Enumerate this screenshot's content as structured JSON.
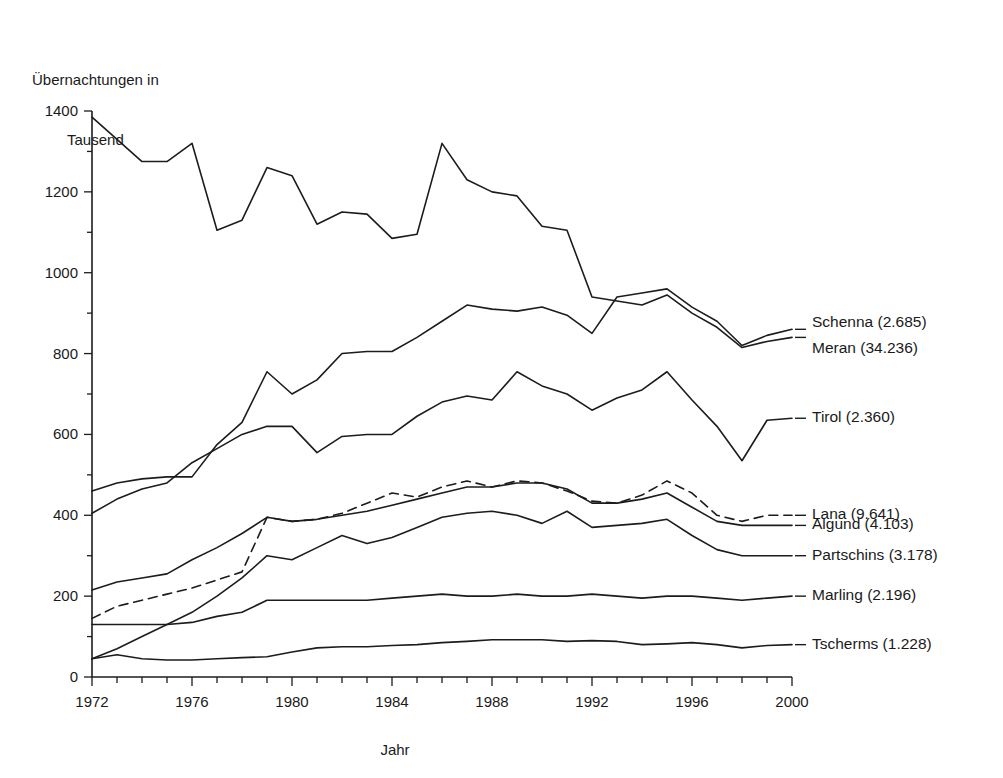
{
  "chart_data": {
    "type": "line",
    "title": "",
    "ylabel": "Übernachtungen in\nTausend",
    "ylabel_line1": "Übernachtungen in",
    "ylabel_line2": "Tausend",
    "xlabel": "Jahr",
    "xlim": [
      1972,
      2000
    ],
    "ylim": [
      0,
      1400
    ],
    "y_ticks": [
      0,
      200,
      400,
      600,
      800,
      1000,
      1200,
      1400
    ],
    "y_tick_labels": [
      "0",
      "200",
      "400",
      "600",
      "800",
      "1000",
      "1200",
      "1400"
    ],
    "y_minor_tick_step": 100,
    "x_ticks": [
      1972,
      1976,
      1980,
      1984,
      1988,
      1992,
      1996,
      2000
    ],
    "x_tick_labels": [
      "1972",
      "1976",
      "1980",
      "1984",
      "1988",
      "1992",
      "1996",
      "2000"
    ],
    "x_minor_tick_step": 1,
    "grid": false,
    "legend_position": "right-inline",
    "line_color": "#1c1c1c",
    "x": [
      1972,
      1973,
      1974,
      1975,
      1976,
      1977,
      1978,
      1979,
      1980,
      1981,
      1982,
      1983,
      1984,
      1985,
      1986,
      1987,
      1988,
      1989,
      1990,
      1991,
      1992,
      1993,
      1994,
      1995,
      1996,
      1997,
      1998,
      1999,
      2000
    ],
    "series": [
      {
        "name": "Meran",
        "label": "Meran (34.236)",
        "count": "34.236",
        "style": "solid",
        "values": [
          1385,
          1330,
          1275,
          1275,
          1320,
          1105,
          1130,
          1260,
          1240,
          1120,
          1150,
          1145,
          1085,
          1095,
          1320,
          1230,
          1200,
          1190,
          1115,
          1105,
          940,
          930,
          920,
          945,
          900,
          865,
          815,
          830,
          840
        ]
      },
      {
        "name": "Schenna",
        "label": "Schenna (2.685)",
        "count": "2.685",
        "style": "solid",
        "values": [
          460,
          480,
          490,
          495,
          495,
          575,
          630,
          755,
          700,
          735,
          800,
          805,
          805,
          840,
          880,
          920,
          910,
          905,
          915,
          895,
          850,
          940,
          950,
          960,
          915,
          880,
          820,
          845,
          860
        ]
      },
      {
        "name": "Tirol",
        "label": "Tirol (2.360)",
        "count": "2.360",
        "style": "solid",
        "values": [
          405,
          440,
          465,
          480,
          530,
          565,
          600,
          620,
          620,
          555,
          595,
          600,
          600,
          645,
          680,
          695,
          685,
          755,
          720,
          700,
          660,
          690,
          710,
          755,
          685,
          620,
          535,
          635,
          640
        ]
      },
      {
        "name": "Lana",
        "label": "Lana (9.641)",
        "count": "9.641",
        "style": "dashed",
        "values": [
          145,
          175,
          190,
          205,
          220,
          240,
          260,
          395,
          385,
          390,
          405,
          430,
          455,
          445,
          470,
          485,
          470,
          485,
          480,
          460,
          435,
          430,
          450,
          485,
          455,
          400,
          385,
          400,
          400
        ]
      },
      {
        "name": "Algund",
        "label": "Algund (4.103)",
        "count": "4.103",
        "style": "solid",
        "values": [
          215,
          235,
          245,
          255,
          290,
          320,
          355,
          395,
          385,
          390,
          400,
          410,
          425,
          440,
          455,
          470,
          470,
          480,
          480,
          465,
          430,
          430,
          440,
          455,
          420,
          385,
          375,
          375,
          375
        ]
      },
      {
        "name": "Partschins",
        "label": "Partschins (3.178)",
        "count": "3.178",
        "style": "solid",
        "values": [
          45,
          70,
          100,
          130,
          160,
          200,
          245,
          300,
          290,
          320,
          350,
          330,
          345,
          370,
          395,
          405,
          410,
          400,
          380,
          410,
          370,
          375,
          380,
          390,
          350,
          315,
          300,
          300,
          300
        ]
      },
      {
        "name": "Marling",
        "label": "Marling (2.196)",
        "count": "2.196",
        "style": "solid",
        "values": [
          130,
          130,
          130,
          130,
          135,
          150,
          160,
          190,
          190,
          190,
          190,
          190,
          195,
          200,
          205,
          200,
          200,
          205,
          200,
          200,
          205,
          200,
          195,
          200,
          200,
          195,
          190,
          195,
          200
        ]
      },
      {
        "name": "Tscherms",
        "label": "Tscherms (1.228)",
        "count": "1.228",
        "style": "solid",
        "values": [
          45,
          55,
          45,
          42,
          42,
          45,
          48,
          50,
          62,
          72,
          75,
          75,
          78,
          80,
          85,
          88,
          92,
          92,
          92,
          88,
          90,
          88,
          80,
          82,
          85,
          80,
          72,
          78,
          80
        ]
      }
    ],
    "legend_entries": [
      {
        "label": "Schenna (2.685)",
        "y_value": 860
      },
      {
        "label": "Meran (34.236)",
        "y_value": 840
      },
      {
        "label": "Tirol (2.360)",
        "y_value": 640
      },
      {
        "label": "Lana (9.641)",
        "y_value": 400
      },
      {
        "label": "Algund (4.103)",
        "y_value": 375
      },
      {
        "label": "Partschins (3.178)",
        "y_value": 300
      },
      {
        "label": "Marling (2.196)",
        "y_value": 200
      },
      {
        "label": "Tscherms (1.228)",
        "y_value": 80
      }
    ]
  }
}
